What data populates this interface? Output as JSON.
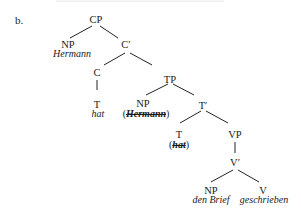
{
  "example_label": "b.",
  "tree": {
    "nodes": {
      "cp": "CP",
      "np_spec": "NP",
      "np_spec_word": "Hermann",
      "c_bar": "C′",
      "c": "C",
      "c_t": "T",
      "c_t_word": "hat",
      "tp": "TP",
      "np_trace": "NP",
      "np_trace_open": "(",
      "np_trace_word": "Hermann",
      "np_trace_close": ")",
      "t_bar": "T′",
      "t": "T",
      "t_trace_open": "(",
      "t_trace_word": "hat",
      "t_trace_close": ")",
      "vp": "VP",
      "v_bar": "V′",
      "np_obj": "NP",
      "np_obj_word": "den Brief",
      "v": "V",
      "v_word": "geschrieben"
    },
    "edges": [
      [
        "CP",
        "NP"
      ],
      [
        "CP",
        "C′"
      ],
      [
        "C′",
        "C"
      ],
      [
        "C′",
        "TP"
      ],
      [
        "C",
        "T"
      ],
      [
        "TP",
        "NP"
      ],
      [
        "TP",
        "T′"
      ],
      [
        "T′",
        "T"
      ],
      [
        "T′",
        "VP"
      ],
      [
        "VP",
        "V′"
      ],
      [
        "V′",
        "NP"
      ],
      [
        "V′",
        "V"
      ]
    ],
    "struck_out": [
      "Hermann (trace)",
      "hat (trace)"
    ]
  }
}
